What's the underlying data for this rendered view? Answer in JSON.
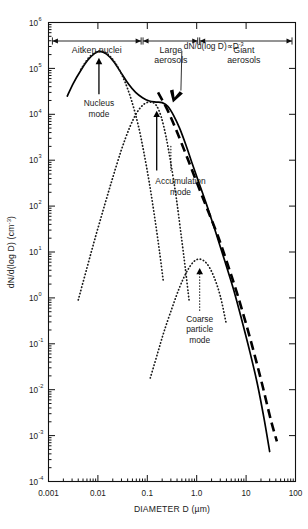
{
  "chart_data": {
    "type": "line",
    "title": "",
    "xlabel": "DIAMETER D (µm)",
    "ylabel": "dN/d(log D) (cm⁻³)",
    "xscale": "log",
    "yscale": "log",
    "xlim": [
      0.001,
      100
    ],
    "ylim": [
      0.0001,
      1000000
    ],
    "grid": false,
    "legend": "none",
    "xticks": [
      "0.001",
      "0.01",
      "0.1",
      "1.0",
      "10",
      "100"
    ],
    "xtick_values": [
      0.001,
      0.01,
      0.1,
      1,
      10,
      100
    ],
    "yticks": [
      "10⁶",
      "10⁵",
      "10⁴",
      "10³",
      "10²",
      "10¹",
      "10⁰",
      "10⁻¹",
      "10⁻²",
      "10⁻³",
      "10⁻⁴"
    ],
    "ytick_mantissa": [
      "10",
      "10",
      "10",
      "10",
      "10",
      "10",
      "10",
      "10",
      "10",
      "10",
      "10"
    ],
    "ytick_exponents": [
      "6",
      "5",
      "4",
      "3",
      "2",
      "1",
      "0",
      "-1",
      "-2",
      "-3",
      "-4"
    ],
    "ytick_values": [
      1000000,
      100000,
      10000,
      1000,
      100,
      10,
      1,
      0.1,
      0.01,
      0.001,
      0.0001
    ],
    "series": [
      {
        "name": "Total measured distribution",
        "style": "solid",
        "points": [
          [
            0.0024,
            25000
          ],
          [
            0.0032,
            48000
          ],
          [
            0.0045,
            90000
          ],
          [
            0.0062,
            150000
          ],
          [
            0.0085,
            210000
          ],
          [
            0.011,
            235000
          ],
          [
            0.015,
            205000
          ],
          [
            0.021,
            140000
          ],
          [
            0.03,
            78000
          ],
          [
            0.042,
            45000
          ],
          [
            0.058,
            30000
          ],
          [
            0.08,
            23000
          ],
          [
            0.11,
            19500
          ],
          [
            0.15,
            18500
          ],
          [
            0.2,
            18000
          ],
          [
            0.26,
            15000
          ],
          [
            0.34,
            9500
          ],
          [
            0.45,
            5000
          ],
          [
            0.6,
            2200
          ],
          [
            0.8,
            880
          ],
          [
            1.1,
            330
          ],
          [
            1.6,
            105
          ],
          [
            2.4,
            28
          ],
          [
            3.6,
            7.0
          ],
          [
            5.5,
            1.6
          ],
          [
            8.0,
            0.36
          ],
          [
            12.0,
            0.065
          ],
          [
            17.0,
            0.013
          ],
          [
            23.0,
            0.0024
          ],
          [
            30.0,
            0.00045
          ]
        ]
      },
      {
        "name": "dN/d(log D) proportional to D^-3",
        "style": "dashed",
        "points": [
          [
            0.165,
            30000
          ],
          [
            0.26,
            12000
          ],
          [
            0.4,
            4100
          ],
          [
            0.65,
            1100
          ],
          [
            1.05,
            290
          ],
          [
            1.7,
            78
          ],
          [
            2.7,
            22
          ],
          [
            4.2,
            5.5
          ],
          [
            6.5,
            1.3
          ],
          [
            10.0,
            0.27
          ],
          [
            15.0,
            0.055
          ],
          [
            22.0,
            0.011
          ],
          [
            32.0,
            0.0021
          ],
          [
            42.0,
            0.00075
          ]
        ]
      },
      {
        "name": "Nucleus mode",
        "style": "dotted",
        "points": [
          [
            0.0045,
            95000
          ],
          [
            0.0065,
            170000
          ],
          [
            0.009,
            225000
          ],
          [
            0.0125,
            235000
          ],
          [
            0.0175,
            185000
          ],
          [
            0.025,
            110000
          ],
          [
            0.035,
            52000
          ],
          [
            0.048,
            20000
          ],
          [
            0.065,
            6000
          ],
          [
            0.085,
            1500
          ],
          [
            0.11,
            320
          ],
          [
            0.14,
            60
          ],
          [
            0.175,
            11
          ],
          [
            0.21,
            2.4
          ]
        ]
      },
      {
        "name": "Accumulation mode",
        "style": "dotted",
        "points": [
          [
            0.004,
            0.9
          ],
          [
            0.006,
            4.5
          ],
          [
            0.009,
            22
          ],
          [
            0.0135,
            100
          ],
          [
            0.02,
            420
          ],
          [
            0.03,
            1700
          ],
          [
            0.044,
            5200
          ],
          [
            0.062,
            11000
          ],
          [
            0.085,
            16500
          ],
          [
            0.115,
            18500
          ],
          [
            0.15,
            16000
          ],
          [
            0.19,
            9000
          ],
          [
            0.24,
            3200
          ],
          [
            0.3,
            850
          ],
          [
            0.38,
            170
          ],
          [
            0.47,
            30
          ],
          [
            0.58,
            5.0
          ],
          [
            0.7,
            0.9
          ]
        ]
      },
      {
        "name": "Coarse particle mode",
        "style": "dotted",
        "points": [
          [
            0.115,
            0.018
          ],
          [
            0.16,
            0.06
          ],
          [
            0.22,
            0.19
          ],
          [
            0.32,
            0.62
          ],
          [
            0.45,
            1.7
          ],
          [
            0.62,
            3.6
          ],
          [
            0.85,
            6.0
          ],
          [
            1.15,
            7.0
          ],
          [
            1.6,
            5.6
          ],
          [
            2.2,
            3.0
          ],
          [
            3.0,
            1.1
          ],
          [
            3.9,
            0.3
          ]
        ]
      }
    ],
    "categories_top": [
      {
        "label_lines": [
          "Aitken nuclei"
        ],
        "from": 0.0012,
        "to": 0.075,
        "center": 0.0095
      },
      {
        "label_lines": [
          "Large",
          "aerosols"
        ],
        "from": 0.082,
        "to": 1.05,
        "center": 0.3
      },
      {
        "label_lines": [
          "Giant",
          "aerosols"
        ],
        "from": 1.15,
        "to": 85,
        "center": 9.0
      }
    ],
    "annotations": [
      {
        "name": "nucleus-mode",
        "lines": [
          "Nucleus",
          "mode"
        ],
        "arrow_to_x": 0.0105,
        "arrow_to_y": 170000,
        "text_x": 0.0105,
        "text_y": 15000
      },
      {
        "name": "accumulation-mode",
        "lines": [
          "Accumulation",
          "mode"
        ],
        "arrow_to_x": 0.155,
        "arrow_to_y": 12000,
        "text_x": 0.08,
        "text_y": 300
      },
      {
        "name": "coarse-particle-mode",
        "lines": [
          "Coarse",
          "particle",
          "mode"
        ],
        "arrow_to_x": 1.15,
        "arrow_to_y": 4.5,
        "text_x": 1.15,
        "text_y": 0.3
      },
      {
        "name": "power-law",
        "text_main": "dN/d(log D)",
        "text_prop": "∝",
        "text_base": "D",
        "text_exp": "-3",
        "arrow_to_x": 0.33,
        "arrow_to_y": 18000
      }
    ]
  }
}
